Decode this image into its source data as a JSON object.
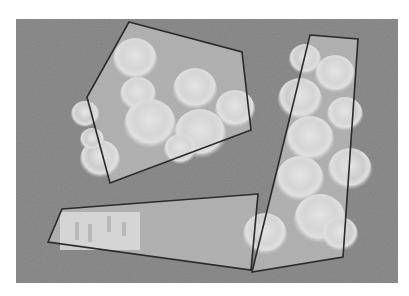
{
  "image": {
    "description": "Grayscale photo of glass chess pieces on a grey surface with three outlined polygon regions",
    "background_color": "#ffffff",
    "surface_color": "#8f8f8f",
    "piece_color": "#d9d9d9",
    "outline_color": "#2a2a2a",
    "photo_rect": {
      "x": 16,
      "y": 19,
      "width": 382,
      "height": 264
    }
  },
  "polygons": [
    {
      "name": "polygon-upper-left",
      "points": "129,22 242,52 251,130 110,183 87,97"
    },
    {
      "name": "polygon-right",
      "points": "310,35 358,39 343,257 252,272"
    },
    {
      "name": "polygon-bottom",
      "points": "62,209 258,194 251,270 48,242"
    }
  ]
}
